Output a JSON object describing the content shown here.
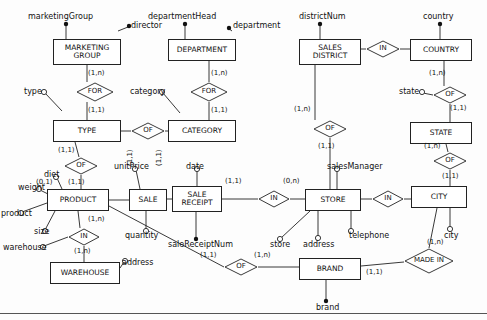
{
  "diagram": {
    "entities": [
      {
        "id": "marketing_group",
        "label": "MARKETING GROUP",
        "x": 53,
        "y": 39,
        "w": 68,
        "h": 26
      },
      {
        "id": "department",
        "label": "DEPARTMENT",
        "x": 168,
        "y": 39,
        "w": 68,
        "h": 22
      },
      {
        "id": "sales_district",
        "label": "SALES DISTRICT",
        "x": 299,
        "y": 39,
        "w": 62,
        "h": 26
      },
      {
        "id": "country",
        "label": "COUNTRY",
        "x": 410,
        "y": 39,
        "w": 62,
        "h": 22
      },
      {
        "id": "type",
        "label": "TYPE",
        "x": 53,
        "y": 120,
        "w": 68,
        "h": 22
      },
      {
        "id": "category",
        "label": "CATEGORY",
        "x": 168,
        "y": 120,
        "w": 68,
        "h": 22
      },
      {
        "id": "state",
        "label": "STATE",
        "x": 410,
        "y": 122,
        "w": 62,
        "h": 22
      },
      {
        "id": "product",
        "label": "PRODUCT",
        "x": 47,
        "y": 189,
        "w": 62,
        "h": 22
      },
      {
        "id": "sale",
        "label": "SALE",
        "x": 129,
        "y": 189,
        "w": 38,
        "h": 22
      },
      {
        "id": "sale_receipt",
        "label": "SALE RECEIPT",
        "x": 172,
        "y": 186,
        "w": 50,
        "h": 26
      },
      {
        "id": "store",
        "label": "STORE",
        "x": 305,
        "y": 189,
        "w": 56,
        "h": 22
      },
      {
        "id": "city",
        "label": "CITY",
        "x": 411,
        "y": 186,
        "w": 56,
        "h": 22
      },
      {
        "id": "warehouse",
        "label": "WAREHOUSE",
        "x": 50,
        "y": 262,
        "w": 70,
        "h": 22
      },
      {
        "id": "brand",
        "label": "BRAND",
        "x": 299,
        "y": 258,
        "w": 62,
        "h": 22
      }
    ],
    "relationships": [
      {
        "id": "for_type",
        "label": "FOR",
        "x": 76,
        "y": 82,
        "w": 38,
        "h": 20
      },
      {
        "id": "for_category",
        "label": "FOR",
        "x": 190,
        "y": 82,
        "w": 38,
        "h": 20
      },
      {
        "id": "in_district_country",
        "label": "IN",
        "x": 366,
        "y": 40,
        "w": 34,
        "h": 18
      },
      {
        "id": "of_type_category",
        "label": "OF",
        "x": 131,
        "y": 124,
        "w": 34,
        "h": 18
      },
      {
        "id": "of_country_state",
        "label": "OF",
        "x": 433,
        "y": 86,
        "w": 34,
        "h": 18
      },
      {
        "id": "of_district_store",
        "label": "OF",
        "x": 313,
        "y": 120,
        "w": 34,
        "h": 18
      },
      {
        "id": "of_product_type",
        "label": "OF",
        "x": 64,
        "y": 157,
        "w": 34,
        "h": 18
      },
      {
        "id": "of_state_city",
        "label": "OF",
        "x": 433,
        "y": 152,
        "w": 34,
        "h": 18
      },
      {
        "id": "in_receipt_store",
        "label": "IN",
        "x": 258,
        "y": 190,
        "w": 32,
        "h": 18
      },
      {
        "id": "in_store_city",
        "label": "IN",
        "x": 372,
        "y": 190,
        "w": 32,
        "h": 18
      },
      {
        "id": "in_product_warehouse",
        "label": "IN",
        "x": 68,
        "y": 228,
        "w": 32,
        "h": 18
      },
      {
        "id": "of_brand",
        "label": "OF",
        "x": 224,
        "y": 258,
        "w": 34,
        "h": 18
      },
      {
        "id": "made_in",
        "label": "MADE IN",
        "x": 404,
        "y": 248,
        "w": 50,
        "h": 24
      }
    ],
    "attributes": [
      {
        "id": "marketingGroup",
        "label": "marketingGroup",
        "x": 28,
        "y": 12
      },
      {
        "id": "director",
        "label": "director",
        "x": 123,
        "y": 23
      },
      {
        "id": "departmentHead",
        "label": "departmentHead",
        "x": 148,
        "y": 12
      },
      {
        "id": "department",
        "label": "department",
        "x": 231,
        "y": 23
      },
      {
        "id": "districtNum",
        "label": "districtNum",
        "x": 299,
        "y": 12
      },
      {
        "id": "country",
        "label": "country",
        "x": 423,
        "y": 12
      },
      {
        "id": "type",
        "label": "type",
        "x": 27,
        "y": 86
      },
      {
        "id": "category",
        "label": "category",
        "x": 140,
        "y": 86
      },
      {
        "id": "state",
        "label": "state",
        "x": 403,
        "y": 86
      },
      {
        "id": "diet",
        "label": "diet",
        "x": 45,
        "y": 171
      },
      {
        "id": "unitPrice",
        "label": "unitPrice",
        "x": 117,
        "y": 163
      },
      {
        "id": "date",
        "label": "date",
        "x": 186,
        "y": 163
      },
      {
        "id": "salesManager",
        "label": "salesManager",
        "x": 327,
        "y": 163
      },
      {
        "id": "weight",
        "label": "weight",
        "x": 20,
        "y": 183
      },
      {
        "id": "product",
        "label": "product",
        "x": 3,
        "y": 210
      },
      {
        "id": "size",
        "label": "size",
        "x": 34,
        "y": 227
      },
      {
        "id": "warehouse",
        "label": "warehouse",
        "x": 6,
        "y": 243
      },
      {
        "id": "quantity",
        "label": "quantity",
        "x": 125,
        "y": 230
      },
      {
        "id": "saleReceiptNum",
        "label": "saleReceiptNum",
        "x": 168,
        "y": 237
      },
      {
        "id": "store",
        "label": "store",
        "x": 273,
        "y": 237
      },
      {
        "id": "address_store",
        "label": "address",
        "x": 302,
        "y": 237
      },
      {
        "id": "telephone",
        "label": "telephone",
        "x": 346,
        "y": 229
      },
      {
        "id": "city",
        "label": "city",
        "x": 444,
        "y": 228
      },
      {
        "id": "address_warehouse",
        "label": "address",
        "x": 122,
        "y": 257
      },
      {
        "id": "brand",
        "label": "brand",
        "x": 319,
        "y": 303
      }
    ],
    "cardinalities": [
      {
        "id": "c1",
        "label": "(1,n)",
        "x": 88,
        "y": 70
      },
      {
        "id": "c2",
        "label": "(1,n)",
        "x": 210,
        "y": 70
      },
      {
        "id": "c3",
        "label": "(1,n)",
        "x": 430,
        "y": 70
      },
      {
        "id": "c4",
        "label": "(1,1)",
        "x": 88,
        "y": 107
      },
      {
        "id": "c5",
        "label": "(1,1)",
        "x": 210,
        "y": 107
      },
      {
        "id": "c6",
        "label": "(1,1)",
        "x": 449,
        "y": 104
      },
      {
        "id": "c7",
        "label": "(1,n)",
        "x": 297,
        "y": 105
      },
      {
        "id": "c8",
        "label": "(1,1)",
        "x": 326,
        "y": 142
      },
      {
        "id": "c9",
        "label": "(1,1)",
        "x": 58,
        "y": 146
      },
      {
        "id": "c10",
        "label": "(0,1)",
        "x": 38,
        "y": 179
      },
      {
        "id": "c11",
        "label": "(1,1)",
        "x": 70,
        "y": 179
      },
      {
        "id": "c12",
        "label": "(1,n)",
        "x": 427,
        "y": 142
      },
      {
        "id": "c13",
        "label": "(1,1)",
        "x": 445,
        "y": 174
      },
      {
        "id": "c14",
        "label": "(1,1)",
        "x": 131,
        "y": 168
      },
      {
        "id": "c15",
        "label": "(1,1)",
        "x": 158,
        "y": 168
      },
      {
        "id": "c16",
        "label": "(1,1)",
        "x": 225,
        "y": 178
      },
      {
        "id": "c17",
        "label": "(0,n)",
        "x": 283,
        "y": 178
      },
      {
        "id": "c18",
        "label": "(1,n)",
        "x": 90,
        "y": 216
      },
      {
        "id": "c19",
        "label": "(1,n)",
        "x": 76,
        "y": 248
      },
      {
        "id": "c20",
        "label": "(1,n)",
        "x": 429,
        "y": 238
      },
      {
        "id": "c21",
        "label": "(1,1)",
        "x": 203,
        "y": 252
      },
      {
        "id": "c22",
        "label": "(1,n)",
        "x": 254,
        "y": 252
      },
      {
        "id": "c23",
        "label": "(1,1)",
        "x": 367,
        "y": 268
      }
    ]
  }
}
